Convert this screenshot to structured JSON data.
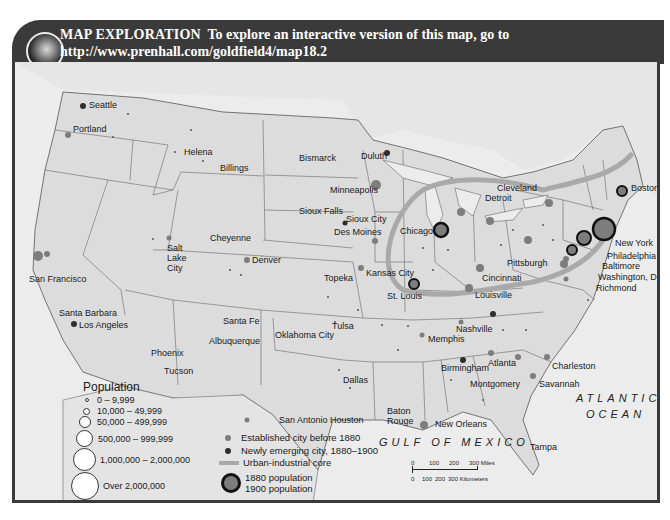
{
  "header": {
    "label": "MAP EXPLORATION",
    "text": "To explore an interactive version of this map, go to",
    "url": "http://www.prenhall.com/goldfield4/map18.2",
    "bar_color": "#3a3a3a"
  },
  "map": {
    "subject": "Urban growth in the United States, 1880-1900",
    "land_color": "#dcdcdc",
    "water_color": "#ececec",
    "core_color": "#a9a9a9",
    "established_color": "#7d7d7d",
    "emerging_color": "#2e2e2e",
    "oceans": {
      "atlantic_line1": "ATLANTIC",
      "atlantic_line2": "OCEAN",
      "gulf": "GULF OF MEXICO"
    },
    "cities": [
      {
        "name": "Seattle",
        "x": 68,
        "y": 104
      },
      {
        "name": "Portland",
        "x": 72,
        "y": 128
      },
      {
        "name": "Helena",
        "x": 182,
        "y": 151
      },
      {
        "name": "Billings",
        "x": 217,
        "y": 166
      },
      {
        "name": "Bismarck",
        "x": 296,
        "y": 157
      },
      {
        "name": "Duluth",
        "x": 357,
        "y": 154
      },
      {
        "name": "Minneapolis",
        "x": 327,
        "y": 189
      },
      {
        "name": "Sioux Falls",
        "x": 296,
        "y": 210
      },
      {
        "name": "Sioux City",
        "x": 343,
        "y": 218
      },
      {
        "name": "Des Moines",
        "x": 331,
        "y": 231
      },
      {
        "name": "Cheyenne",
        "x": 208,
        "y": 236
      },
      {
        "name": "Salt Lake City",
        "x": 165,
        "y": 244
      },
      {
        "name": "Denver",
        "x": 249,
        "y": 259
      },
      {
        "name": "San Francisco",
        "x": 26,
        "y": 278
      },
      {
        "name": "Chicago",
        "x": 398,
        "y": 232
      },
      {
        "name": "Detroit",
        "x": 483,
        "y": 196
      },
      {
        "name": "Cleveland",
        "x": 494,
        "y": 186
      },
      {
        "name": "Boston",
        "x": 628,
        "y": 187
      },
      {
        "name": "New York",
        "x": 612,
        "y": 242
      },
      {
        "name": "Philadelphia",
        "x": 604,
        "y": 254
      },
      {
        "name": "Baltimore",
        "x": 599,
        "y": 264
      },
      {
        "name": "Washington, D.C.",
        "x": 596,
        "y": 275
      },
      {
        "name": "Richmond",
        "x": 593,
        "y": 287
      },
      {
        "name": "Pittsburgh",
        "x": 503,
        "y": 262
      },
      {
        "name": "Cincinnati",
        "x": 479,
        "y": 276
      },
      {
        "name": "Louisville",
        "x": 473,
        "y": 293
      },
      {
        "name": "Kansas City",
        "x": 363,
        "y": 271
      },
      {
        "name": "Topeka",
        "x": 322,
        "y": 276
      },
      {
        "name": "St. Louis",
        "x": 385,
        "y": 294
      },
      {
        "name": "Santa Fe",
        "x": 220,
        "y": 320
      },
      {
        "name": "Albuquerque",
        "x": 206,
        "y": 339
      },
      {
        "name": "Oklahoma City",
        "x": 272,
        "y": 333
      },
      {
        "name": "Tulsa",
        "x": 329,
        "y": 325
      },
      {
        "name": "Santa Barbara",
        "x": 56,
        "y": 311
      },
      {
        "name": "Los Angeles",
        "x": 76,
        "y": 324
      },
      {
        "name": "Phoenix",
        "x": 148,
        "y": 351
      },
      {
        "name": "Tucson",
        "x": 161,
        "y": 370
      },
      {
        "name": "Nashville",
        "x": 453,
        "y": 327
      },
      {
        "name": "Memphis",
        "x": 426,
        "y": 338
      },
      {
        "name": "Birmingham",
        "x": 439,
        "y": 367
      },
      {
        "name": "Atlanta",
        "x": 486,
        "y": 361
      },
      {
        "name": "Montgomery",
        "x": 467,
        "y": 382
      },
      {
        "name": "Charleston",
        "x": 549,
        "y": 365
      },
      {
        "name": "Savannah",
        "x": 536,
        "y": 382
      },
      {
        "name": "Dallas",
        "x": 340,
        "y": 378
      },
      {
        "name": "San Antonio",
        "x": 276,
        "y": 418
      },
      {
        "name": "Houston",
        "x": 327,
        "y": 418
      },
      {
        "name": "Baton Rouge",
        "x": 384,
        "y": 410
      },
      {
        "name": "New Orleans",
        "x": 432,
        "y": 422
      },
      {
        "name": "Tampa",
        "x": 527,
        "y": 445
      }
    ]
  },
  "legend": {
    "population_title": "Population",
    "population_classes": [
      {
        "label": "0 – 9,999",
        "size": 4
      },
      {
        "label": "10,000 – 49,999",
        "size": 8
      },
      {
        "label": "50,000 – 499,999",
        "size": 13
      },
      {
        "label": "500,000 – 999,999",
        "size": 19
      },
      {
        "label": "1,000,000 – 2,000,000",
        "size": 27
      },
      {
        "label": "Over 2,000,000",
        "size": 32
      }
    ],
    "symbols": [
      {
        "label": "Established city before 1880",
        "type": "established"
      },
      {
        "label": "Newly emerging city, 1880–1900",
        "type": "emerging"
      },
      {
        "label": "Urban-industrial core",
        "type": "core"
      }
    ],
    "growth": {
      "label_1880": "1880 population",
      "label_1900": "1900 population"
    }
  },
  "scale": {
    "miles_ticks": [
      "0",
      "100",
      "200",
      "300 Miles"
    ],
    "km_ticks": [
      "0",
      "100",
      "200",
      "300 Kilometers"
    ]
  }
}
